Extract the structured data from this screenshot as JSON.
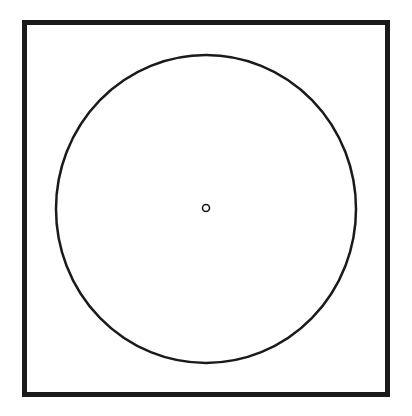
{
  "diagram": {
    "elements": [
      {
        "name": "frame",
        "shape": "square"
      },
      {
        "name": "outer-circle",
        "shape": "circle"
      },
      {
        "name": "center-point",
        "shape": "small circle"
      }
    ],
    "colors": {
      "stroke": "#1a1a1a",
      "background": "#ffffff"
    }
  }
}
